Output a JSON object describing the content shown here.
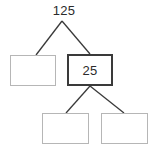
{
  "diagram": {
    "type": "factor-tree",
    "title": "",
    "root": {
      "label": "125",
      "value": 125,
      "filled": true
    },
    "nodes": [
      {
        "id": "root",
        "label": "125",
        "shape": "text",
        "filled": true,
        "border_color": "#ffffff"
      },
      {
        "id": "left",
        "label": "",
        "shape": "rectangle",
        "filled": false,
        "border_color": "#b6b6b6"
      },
      {
        "id": "mid",
        "label": "25",
        "shape": "rectangle",
        "filled": true,
        "border_color": "#3a3a3a"
      },
      {
        "id": "bottom_left",
        "label": "",
        "shape": "rectangle",
        "filled": false,
        "border_color": "#b6b6b6"
      },
      {
        "id": "bottom_right",
        "label": "",
        "shape": "rectangle",
        "filled": false,
        "border_color": "#b6b6b6"
      }
    ],
    "edges": [
      {
        "from": "root",
        "to": "left"
      },
      {
        "from": "root",
        "to": "mid"
      },
      {
        "from": "mid",
        "to": "bottom_left"
      },
      {
        "from": "mid",
        "to": "bottom_right"
      }
    ],
    "colors": {
      "background": "#ffffff",
      "line": "#3a3a3a",
      "text": "#2b2b2b",
      "box_border_light": "#b6b6b6",
      "box_border_dark": "#3a3a3a"
    }
  }
}
